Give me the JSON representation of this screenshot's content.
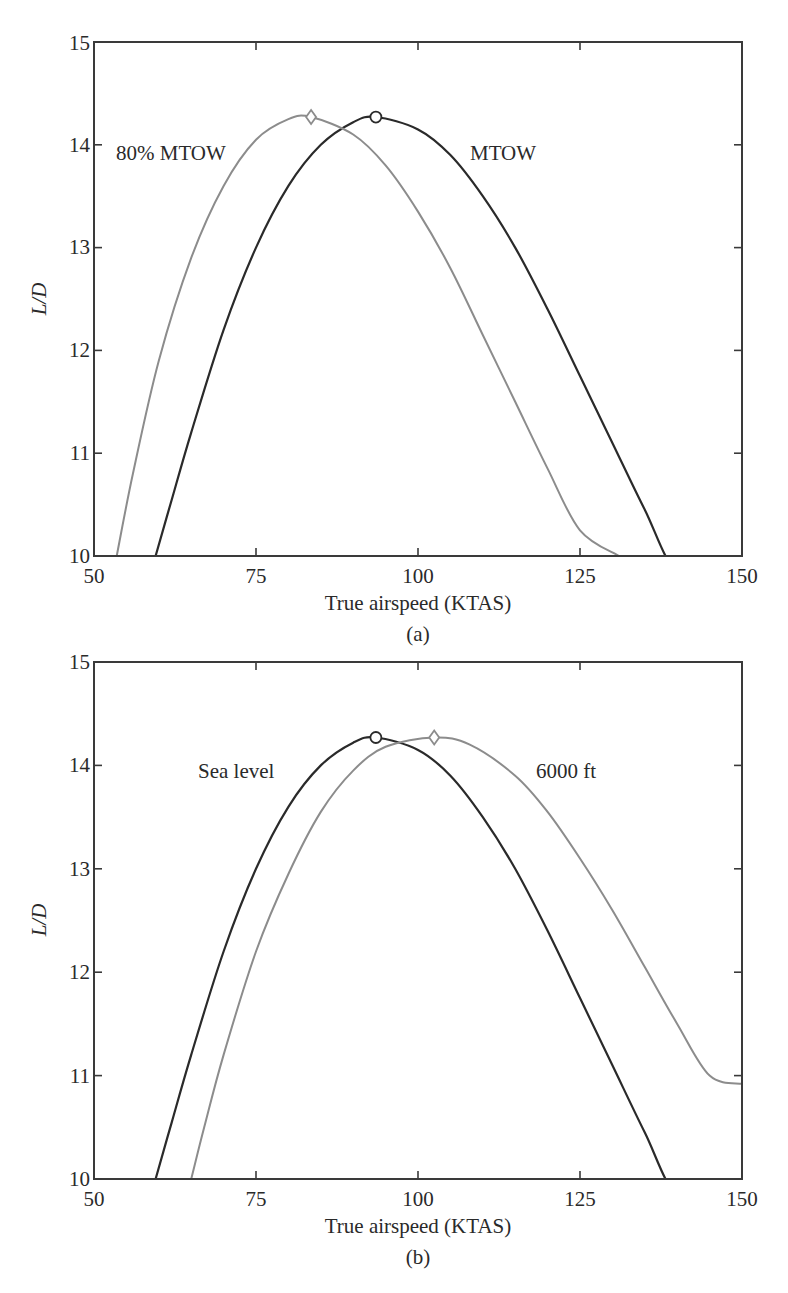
{
  "figure": {
    "panels": [
      {
        "id": "a",
        "caption": "(a)",
        "xlabel": "True airspeed (KTAS)",
        "ylabel": "L/D",
        "xticks": [
          "50",
          "75",
          "100",
          "125",
          "150"
        ],
        "yticks": [
          "10",
          "11",
          "12",
          "13",
          "14",
          "15"
        ],
        "annotations": [
          {
            "text": "80% MTOW",
            "x": 61,
            "y": 13.95
          },
          {
            "text": "MTOW",
            "x": 112,
            "y": 13.95
          }
        ]
      },
      {
        "id": "b",
        "caption": "(b)",
        "xlabel": "True airspeed (KTAS)",
        "ylabel": "L/D",
        "xticks": [
          "50",
          "75",
          "100",
          "125",
          "150"
        ],
        "yticks": [
          "10",
          "11",
          "12",
          "13",
          "14",
          "15"
        ],
        "annotations": [
          {
            "text": "Sea level",
            "x": 73.5,
            "y": 13.95
          },
          {
            "text": "6000 ft",
            "x": 113.5,
            "y": 13.95
          }
        ]
      }
    ]
  },
  "chart_data": [
    {
      "type": "line",
      "title": "(a)",
      "xlabel": "True airspeed (KTAS)",
      "ylabel": "L/D",
      "xlim": [
        50,
        150
      ],
      "ylim": [
        10,
        15
      ],
      "grid": false,
      "legend": "inline text labels",
      "series": [
        {
          "name": "MTOW",
          "color": "#2a2a2a",
          "marker_at_max": "circle",
          "max_point": [
            93.5,
            14.27
          ],
          "x": [
            59.5,
            62,
            65,
            70,
            75,
            80,
            85,
            90,
            93.5,
            100,
            105,
            110,
            115,
            120,
            125,
            130,
            135,
            140,
            146
          ],
          "y": [
            10.0,
            10.55,
            11.2,
            12.2,
            13.0,
            13.6,
            14.0,
            14.22,
            14.27,
            14.15,
            13.9,
            13.5,
            13.0,
            12.4,
            11.75,
            11.1,
            10.45,
            9.85,
            10.0
          ]
        },
        {
          "name": "80% MTOW",
          "color": "#8c8c8c",
          "marker_at_max": "diamond",
          "max_point": [
            83.5,
            14.27
          ],
          "x": [
            53.5,
            56,
            60,
            65,
            70,
            75,
            80,
            83.5,
            90,
            95,
            100,
            105,
            110,
            115,
            120,
            125,
            131
          ],
          "y": [
            10.0,
            10.8,
            11.9,
            12.9,
            13.6,
            14.05,
            14.25,
            14.27,
            14.1,
            13.8,
            13.35,
            12.8,
            12.15,
            11.5,
            10.85,
            10.25,
            10.0
          ]
        }
      ]
    },
    {
      "type": "line",
      "title": "(b)",
      "xlabel": "True airspeed (KTAS)",
      "ylabel": "L/D",
      "xlim": [
        50,
        150
      ],
      "ylim": [
        10,
        15
      ],
      "grid": false,
      "legend": "inline text labels",
      "series": [
        {
          "name": "Sea level",
          "color": "#2a2a2a",
          "marker_at_max": "circle",
          "max_point": [
            93.5,
            14.27
          ],
          "x": [
            59.5,
            62,
            65,
            70,
            75,
            80,
            85,
            90,
            93.5,
            100,
            105,
            110,
            115,
            120,
            125,
            130,
            135,
            140,
            146
          ],
          "y": [
            10.0,
            10.55,
            11.2,
            12.2,
            13.0,
            13.6,
            14.0,
            14.22,
            14.27,
            14.15,
            13.9,
            13.5,
            13.0,
            12.4,
            11.75,
            11.1,
            10.45,
            9.85,
            10.0
          ]
        },
        {
          "name": "6000 ft",
          "color": "#8c8c8c",
          "marker_at_max": "diamond",
          "max_point": [
            102.5,
            14.27
          ],
          "x": [
            65,
            67,
            70,
            75,
            80,
            85,
            90,
            95,
            102.5,
            108,
            115,
            120,
            125,
            130,
            135,
            140,
            145,
            150
          ],
          "y": [
            10.0,
            10.5,
            11.2,
            12.2,
            12.95,
            13.55,
            13.95,
            14.18,
            14.27,
            14.2,
            13.9,
            13.55,
            13.1,
            12.6,
            12.05,
            11.5,
            11.0,
            10.92
          ]
        }
      ]
    }
  ]
}
